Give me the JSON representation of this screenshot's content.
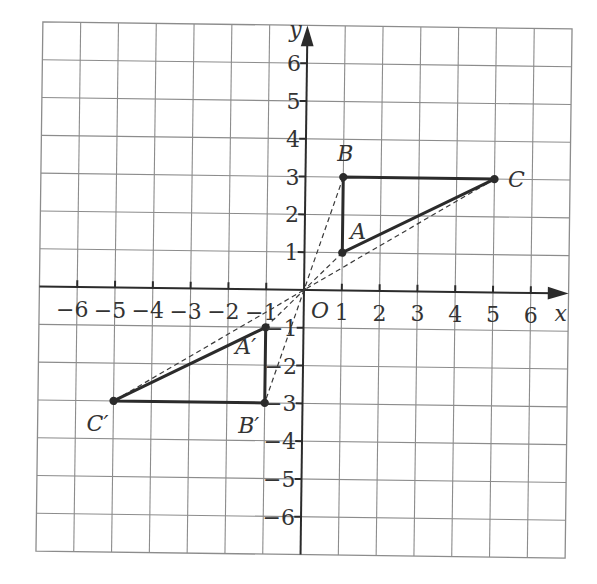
{
  "diagram": {
    "type": "coordinate-grid",
    "grid": {
      "min": -7,
      "max": 7,
      "color": "#8c8c8c"
    },
    "axes": {
      "x_label": "x",
      "y_label": "y",
      "origin_label": "O",
      "x_ticks": [
        "−6",
        "−5",
        "−4",
        "−3",
        "−2",
        "−1",
        "1",
        "2",
        "3",
        "4",
        "5",
        "6"
      ],
      "y_ticks": [
        "6",
        "5",
        "4",
        "3",
        "2",
        "1",
        "−1",
        "−2",
        "−3",
        "−4",
        "−5",
        "−6"
      ],
      "x_tick_values": [
        -6,
        -5,
        -4,
        -3,
        -2,
        -1,
        1,
        2,
        3,
        4,
        5,
        6
      ],
      "y_tick_values": [
        6,
        5,
        4,
        3,
        2,
        1,
        -1,
        -2,
        -3,
        -4,
        -5,
        -6
      ]
    },
    "triangle_original": {
      "name": "ABC",
      "points": [
        {
          "label": "A",
          "x": 1,
          "y": 1
        },
        {
          "label": "B",
          "x": 1,
          "y": 3
        },
        {
          "label": "C",
          "x": 5,
          "y": 3
        }
      ]
    },
    "triangle_image": {
      "name": "A'B'C'",
      "points": [
        {
          "label": "A′",
          "x": -1,
          "y": -1
        },
        {
          "label": "B′",
          "x": -1,
          "y": -3
        },
        {
          "label": "C′",
          "x": -5,
          "y": -3
        }
      ]
    },
    "transformation": "Enlargement, centre O, scale factor −1 (rotation of 180° about O)",
    "dashed_rays": [
      {
        "from": "B",
        "to": "B′",
        "through": "O"
      },
      {
        "from": "A",
        "to": "A′",
        "through": "O"
      },
      {
        "from": "C",
        "to": "C′",
        "through": "O"
      }
    ]
  }
}
